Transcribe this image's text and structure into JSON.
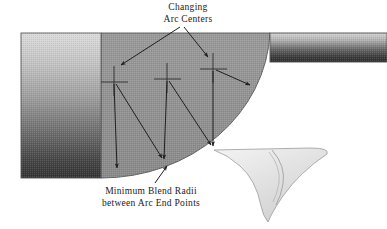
{
  "figure": {
    "width": 387,
    "height": 229,
    "background_color": "#ffffff"
  },
  "annotations": {
    "arc_centers": {
      "line1": "Changing",
      "line2": "Arc Centers"
    },
    "blend_radii": {
      "line1": "Minimum Blend Radii",
      "line2": "between Arc End Points"
    }
  },
  "colors": {
    "body_fill_light": "#d8d8d8",
    "body_fill_dark": "#3a3a3a",
    "fan_fill": "#8c8c8c",
    "arm_fill_light": "#d2d2d2",
    "arm_fill_dark": "#2f2f2f",
    "fin_fill_light": "#efefef",
    "fin_fill_dark": "#cccccc",
    "outline": "#4a4a4a",
    "leader": "#2b2b2b",
    "text": "#1a1a1a"
  },
  "geometry": {
    "left_block": {
      "x": 21,
      "y": 33,
      "width": 80,
      "height": 145
    },
    "fan_sector": {
      "apex_x": 101,
      "apex_y": 33,
      "radius": 152
    },
    "right_arm": {
      "x": 270,
      "y": 33,
      "width": 117,
      "height": 29
    },
    "arc_centers": [
      {
        "id": "center-1",
        "x": 114,
        "y": 82
      },
      {
        "id": "center-2",
        "x": 167,
        "y": 79
      },
      {
        "id": "center-3",
        "x": 213,
        "y": 69
      }
    ],
    "blend_arrow_tips": [
      {
        "id": "tip-1",
        "x": 117,
        "y": 171
      },
      {
        "id": "tip-2",
        "x": 164,
        "y": 162
      },
      {
        "id": "tip-3",
        "x": 213,
        "y": 149
      },
      {
        "id": "tip-4",
        "x": 253,
        "y": 86
      }
    ]
  }
}
